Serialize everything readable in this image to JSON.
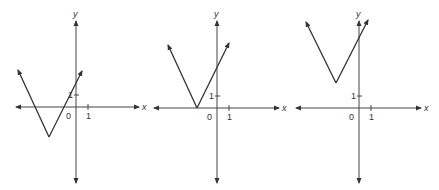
{
  "figure": {
    "graphs": [
      {
        "id": "graph-1",
        "origin_px": [
          76,
          107
        ],
        "unit_px": 12,
        "x_axis": {
          "from": 16,
          "to": 139,
          "label": "x"
        },
        "y_axis": {
          "from": 183,
          "to": 21,
          "label": "y"
        },
        "origin_label": "0",
        "tick_label_x": "1",
        "tick_label_y": "1",
        "vertex_px": [
          49,
          137
        ],
        "left_end_px": [
          18,
          70
        ],
        "right_end_px": [
          82,
          71
        ]
      },
      {
        "id": "graph-2",
        "origin_px": [
          217,
          108
        ],
        "unit_px": 12,
        "x_axis": {
          "from": 154,
          "to": 279,
          "label": "x"
        },
        "y_axis": {
          "from": 183,
          "to": 21,
          "label": "y"
        },
        "origin_label": "0",
        "tick_label_x": "1",
        "tick_label_y": "1",
        "vertex_px": [
          197,
          108
        ],
        "left_end_px": [
          168,
          45
        ],
        "right_end_px": [
          229,
          43
        ]
      },
      {
        "id": "graph-3",
        "origin_px": [
          359,
          108
        ],
        "unit_px": 12,
        "x_axis": {
          "from": 296,
          "to": 421,
          "label": "x"
        },
        "y_axis": {
          "from": 183,
          "to": 21,
          "label": "y"
        },
        "origin_label": "0",
        "tick_label_x": "1",
        "tick_label_y": "1",
        "vertex_px": [
          336,
          83
        ],
        "left_end_px": [
          306,
          22
        ],
        "right_end_px": [
          368,
          20
        ]
      }
    ]
  },
  "colors": {
    "line": "#333333",
    "axis": "#444444"
  }
}
